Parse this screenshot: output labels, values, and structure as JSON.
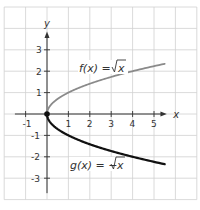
{
  "chart_data": {
    "type": "line",
    "title": "",
    "xlabel": "x",
    "ylabel": "y",
    "xlim": [
      -2,
      7
    ],
    "ylim": [
      -4,
      5
    ],
    "grid": true,
    "x_ticks": [
      -1,
      1,
      2,
      3,
      4,
      5
    ],
    "x_tick_labels": [
      "-1",
      "1",
      "2",
      "3",
      "4",
      "5"
    ],
    "y_ticks": [
      3,
      2,
      1,
      -1,
      -2,
      -3
    ],
    "y_tick_labels": [
      "3",
      "2",
      "1",
      "-1",
      "-2",
      "-3"
    ],
    "series": [
      {
        "name": "f(x) = √x",
        "label_prefix": "f(x) = ",
        "label_radical": "x",
        "color": "#8a8a8a",
        "x": [
          0,
          0.25,
          0.5,
          1,
          2,
          3,
          4,
          5,
          5.5
        ],
        "y": [
          0,
          0.5,
          0.71,
          1,
          1.41,
          1.73,
          2,
          2.24,
          2.35
        ]
      },
      {
        "name": "g(x) = −√x",
        "label_prefix": "g(x) = −",
        "label_radical": "x",
        "color": "#111111",
        "x": [
          0,
          0.25,
          0.5,
          1,
          2,
          3,
          4,
          5,
          5.5
        ],
        "y": [
          0,
          -0.5,
          -0.71,
          -1,
          -1.41,
          -1.73,
          -2,
          -2.24,
          -2.35
        ]
      }
    ],
    "points": [
      {
        "x": 0,
        "y": 0,
        "label": "origin",
        "color": "#111111"
      }
    ],
    "colors": {
      "grid": "#d0d0d0",
      "axis": "#333333"
    }
  }
}
